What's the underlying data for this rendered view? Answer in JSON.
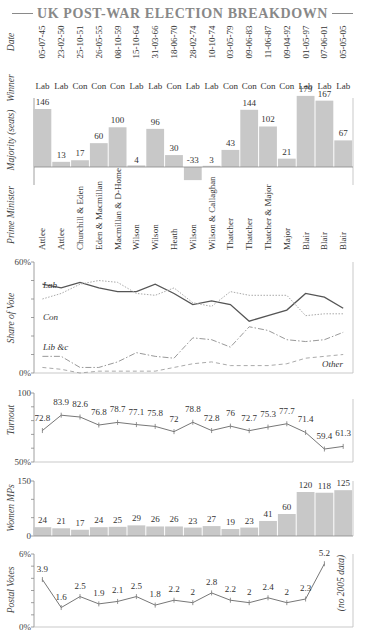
{
  "title": "UK POST-WAR ELECTION BREAKDOWN",
  "row_labels": {
    "date": "Date",
    "winner": "Winner",
    "majority": "Majority (seats)",
    "pm": "Prime Minister",
    "share": "Share of Vote",
    "turnout": "Turnout",
    "women": "Women MPs",
    "postal": "Postal Votes"
  },
  "postal_note": "(no 2005 data)",
  "colors": {
    "bar": "#c8c8c8",
    "lab_line": "#555555",
    "con_line": "#aaaaaa",
    "lib_line": "#999999",
    "other_line": "#aaaaaa",
    "axis": "#888888",
    "text": "#444444"
  },
  "chart_data": [
    {
      "type": "table",
      "title": "Elections",
      "columns": [
        "Date",
        "Winner",
        "Prime Minister"
      ],
      "dates": [
        "05-07-45",
        "23-02-50",
        "25-10-51",
        "26-05-55",
        "08-10-59",
        "15-10-64",
        "31-03-66",
        "18-06-70",
        "28-02-74",
        "10-10-74",
        "03-05-79",
        "09-06-83",
        "11-06-87",
        "09-04-92",
        "01-05-97",
        "07-06-01",
        "05-05-05"
      ],
      "winners": [
        "Lab",
        "Lab",
        "Con",
        "Con",
        "Con",
        "Lab",
        "Lab",
        "Con",
        "Lab",
        "Lab",
        "Con",
        "Con",
        "Con",
        "Con",
        "Lab",
        "Lab",
        "Lab"
      ],
      "prime_ministers": [
        "Attlee",
        "Attlee",
        "Churchill & Eden",
        "Eden & Macmillan",
        "Macmillan & D-Home",
        "Wilson",
        "Wilson",
        "Heath",
        "Wilson",
        "Wilson & Callaghan",
        "Thatcher",
        "Thatcher",
        "Thatcher & Major",
        "Major",
        "Blair",
        "Blair",
        "Blair"
      ]
    },
    {
      "type": "bar",
      "title": "Majority (seats)",
      "categories": [
        "05-07-45",
        "23-02-50",
        "25-10-51",
        "26-05-55",
        "08-10-59",
        "15-10-64",
        "31-03-66",
        "18-06-70",
        "28-02-74",
        "10-10-74",
        "03-05-79",
        "09-06-83",
        "11-06-87",
        "09-04-92",
        "01-05-97",
        "07-06-01",
        "05-05-05"
      ],
      "values": [
        146,
        13,
        17,
        60,
        100,
        4,
        96,
        30,
        -33,
        3,
        43,
        144,
        102,
        21,
        179,
        167,
        67
      ],
      "ylabel": "Majority (seats)",
      "ylim": [
        -40,
        190
      ]
    },
    {
      "type": "line",
      "title": "Share of Vote",
      "ylabel": "Share of Vote",
      "ylim": [
        0,
        60
      ],
      "yticks": [
        "0%",
        "60%"
      ],
      "categories": [
        "05-07-45",
        "23-02-50",
        "25-10-51",
        "26-05-55",
        "08-10-59",
        "15-10-64",
        "31-03-66",
        "18-06-70",
        "28-02-74",
        "10-10-74",
        "03-05-79",
        "09-06-83",
        "11-06-87",
        "09-04-92",
        "01-05-97",
        "07-06-01",
        "05-05-05"
      ],
      "series": [
        {
          "name": "Lab",
          "values": [
            48,
            46,
            49,
            46,
            44,
            44,
            48,
            43,
            37,
            39,
            37,
            28,
            31,
            34,
            43,
            41,
            35
          ]
        },
        {
          "name": "Con",
          "values": [
            40,
            43,
            48,
            50,
            49,
            43,
            42,
            46,
            38,
            36,
            44,
            42,
            42,
            42,
            31,
            32,
            32
          ]
        },
        {
          "name": "Lib &c",
          "values": [
            9,
            9,
            3,
            3,
            6,
            11,
            9,
            8,
            19,
            18,
            14,
            25,
            23,
            18,
            17,
            18,
            22
          ]
        },
        {
          "name": "Other",
          "values": [
            3,
            2,
            0,
            1,
            1,
            1,
            1,
            3,
            5,
            6,
            4,
            4,
            4,
            5,
            8,
            9,
            10
          ]
        }
      ]
    },
    {
      "type": "line",
      "title": "Turnout",
      "ylabel": "Turnout",
      "ylim": [
        50,
        100
      ],
      "yticks": [
        "50%",
        "100"
      ],
      "categories": [
        "05-07-45",
        "23-02-50",
        "25-10-51",
        "26-05-55",
        "08-10-59",
        "15-10-64",
        "31-03-66",
        "18-06-70",
        "28-02-74",
        "10-10-74",
        "03-05-79",
        "09-06-83",
        "11-06-87",
        "09-04-92",
        "01-05-97",
        "07-06-01",
        "05-05-05"
      ],
      "values": [
        72.8,
        83.9,
        82.6,
        76.8,
        78.7,
        77.1,
        75.8,
        72,
        78.8,
        72.8,
        76,
        72.7,
        75.3,
        77.7,
        71.4,
        59.4,
        61.3
      ]
    },
    {
      "type": "bar",
      "title": "Women MPs",
      "ylabel": "Women MPs",
      "ylim": [
        0,
        150
      ],
      "yticks": [
        "0",
        "150"
      ],
      "categories": [
        "05-07-45",
        "23-02-50",
        "25-10-51",
        "26-05-55",
        "08-10-59",
        "15-10-64",
        "31-03-66",
        "18-06-70",
        "28-02-74",
        "10-10-74",
        "03-05-79",
        "09-06-83",
        "11-06-87",
        "09-04-92",
        "01-05-97",
        "07-06-01",
        "05-05-05"
      ],
      "values": [
        24,
        21,
        17,
        24,
        25,
        29,
        26,
        26,
        23,
        27,
        19,
        23,
        41,
        60,
        120,
        118,
        125
      ]
    },
    {
      "type": "line",
      "title": "Postal Votes",
      "ylabel": "Postal Votes",
      "ylim": [
        0,
        6
      ],
      "yticks": [
        "0%",
        "6%"
      ],
      "annotations": [
        "(no 2005 data)"
      ],
      "categories": [
        "05-07-45",
        "23-02-50",
        "25-10-51",
        "26-05-55",
        "08-10-59",
        "15-10-64",
        "31-03-66",
        "18-06-70",
        "28-02-74",
        "10-10-74",
        "03-05-79",
        "09-06-83",
        "11-06-87",
        "09-04-92",
        "01-05-97",
        "07-06-01"
      ],
      "values": [
        3.9,
        1.6,
        2.5,
        1.9,
        2.1,
        2.5,
        1.8,
        2.2,
        2,
        2.8,
        2.2,
        2,
        2.4,
        2,
        2.3,
        5.2
      ]
    }
  ]
}
